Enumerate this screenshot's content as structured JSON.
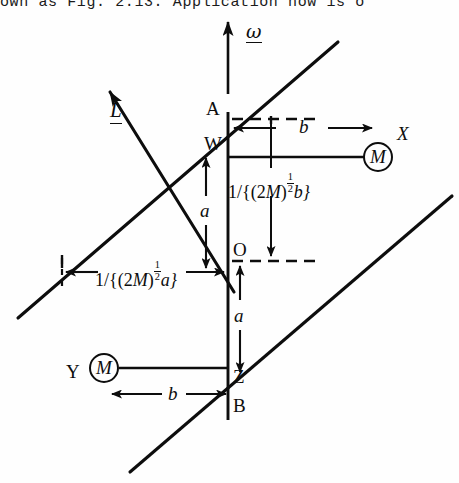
{
  "page": {
    "clipped_header_text": "own as Fig. 2.13. Application now is o",
    "background_color": "#fefefe",
    "ink_color": "#0d0d0d",
    "width": 459,
    "height": 483
  },
  "figure": {
    "type": "physics-mechanics-diagram",
    "vectors": [
      {
        "name": "angular-velocity",
        "label": "ω",
        "underlined": true,
        "direction": "up",
        "tip_x": 228,
        "tip_y": 18,
        "tail_x": 228,
        "tail_y": 92
      },
      {
        "name": "angular-momentum",
        "label": "L",
        "underlined": true,
        "direction": "up-left",
        "tip_x": 106,
        "tip_y": 88,
        "tail_x": 232,
        "tail_y": 290
      }
    ],
    "points": [
      {
        "name": "A",
        "label": "A",
        "x": 228,
        "y": 115
      },
      {
        "name": "W",
        "label": "W",
        "x": 228,
        "y": 150
      },
      {
        "name": "O",
        "label": "O",
        "x": 228,
        "y": 258
      },
      {
        "name": "Z",
        "label": "Z",
        "x": 228,
        "y": 380
      },
      {
        "name": "B",
        "label": "B",
        "x": 228,
        "y": 406
      },
      {
        "name": "X",
        "label": "X",
        "x": 400,
        "y": 134
      },
      {
        "name": "Y",
        "label": "Y",
        "x": 70,
        "y": 372
      }
    ],
    "masses": [
      {
        "name": "mass-upper-right",
        "label": "M",
        "cx": 378,
        "cy": 157,
        "attached_to": "X"
      },
      {
        "name": "mass-lower-left",
        "label": "M",
        "cx": 104,
        "cy": 368,
        "attached_to": "Y"
      }
    ],
    "dimensions": [
      {
        "name": "b-upper",
        "label": "b",
        "orientation": "horizontal",
        "x": 305,
        "y": 126
      },
      {
        "name": "b-lower",
        "label": "b",
        "orientation": "horizontal",
        "x": 156,
        "y": 393
      },
      {
        "name": "a-upper",
        "label": "a",
        "orientation": "vertical",
        "x": 199,
        "y": 210
      },
      {
        "name": "a-lower",
        "label": "a",
        "orientation": "vertical",
        "x": 243,
        "y": 315
      }
    ],
    "annotations": [
      {
        "name": "offset-b-formula",
        "x": 231,
        "y": 177,
        "parts": {
          "lead": "1/{(2",
          "var": "M",
          "close_paren": ")",
          "exp_num": "1",
          "exp_den": "2",
          "tail": "b}"
        },
        "plain": "1/{(2M)^(1/2) b}"
      },
      {
        "name": "offset-a-formula",
        "x": 78,
        "y": 265,
        "parts": {
          "lead": "1/{(2",
          "var": "M",
          "close_paren": ")",
          "exp_num": "1",
          "exp_den": "2",
          "tail": "a}"
        },
        "plain": "1/{(2M)^(1/2) a}"
      }
    ],
    "rotation_axis": {
      "name": "shaft-AB",
      "x": 228,
      "top_y": 112,
      "bottom_y": 420
    },
    "principal_lines": [
      {
        "name": "line-up-slope-upper",
        "x1": 18,
        "y1": 318,
        "x2": 338,
        "y2": 42
      },
      {
        "name": "line-up-slope-lower",
        "x1": 130,
        "y1": 472,
        "x2": 452,
        "y2": 196
      }
    ]
  }
}
